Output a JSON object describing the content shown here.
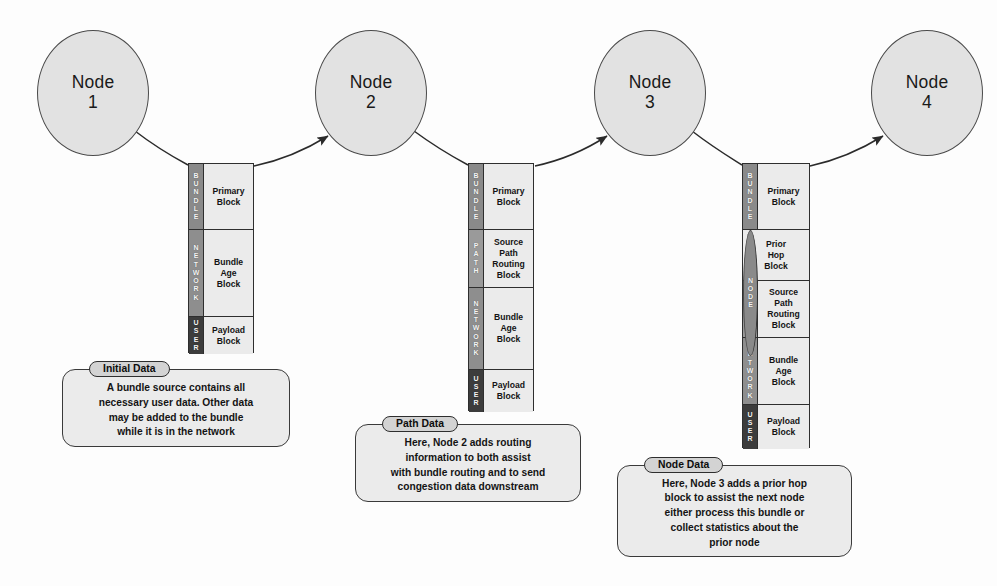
{
  "diagram": {
    "background": "#fdfdfd",
    "nodes": [
      {
        "label": "Node",
        "number": "1"
      },
      {
        "label": "Node",
        "number": "2"
      },
      {
        "label": "Node",
        "number": "3"
      },
      {
        "label": "Node",
        "number": "4"
      }
    ],
    "stacks": [
      {
        "name": "bundle-stack-1",
        "rows": [
          {
            "tier": "BUNDLE",
            "tier_key": "bundle",
            "tier_color": "#8a8a8a",
            "block": [
              "Primary",
              "Block"
            ]
          },
          {
            "tier": "NETWORK",
            "tier_key": "network",
            "tier_color": "#8e8e8e",
            "block": [
              "Bundle",
              "Age",
              "Block"
            ]
          },
          {
            "tier": "USER",
            "tier_key": "user",
            "tier_color": "#3c3c3c",
            "block": [
              "Payload",
              "Block"
            ]
          }
        ]
      },
      {
        "name": "bundle-stack-2",
        "rows": [
          {
            "tier": "BUNDLE",
            "tier_key": "bundle",
            "tier_color": "#8a8a8a",
            "block": [
              "Primary",
              "Block"
            ]
          },
          {
            "tier": "PATH",
            "tier_key": "path",
            "tier_color": "#9a9a9a",
            "block": [
              "Source",
              "Path",
              "Routing",
              "Block"
            ]
          },
          {
            "tier": "NETWORK",
            "tier_key": "network",
            "tier_color": "#8e8e8e",
            "block": [
              "Bundle",
              "Age",
              "Block"
            ]
          },
          {
            "tier": "USER",
            "tier_key": "user",
            "tier_color": "#3c3c3c",
            "block": [
              "Payload",
              "Block"
            ]
          }
        ]
      },
      {
        "name": "bundle-stack-3",
        "rows": [
          {
            "tier": "BUNDLE",
            "tier_key": "bundle",
            "tier_color": "#8a8a8a",
            "block": [
              "Primary",
              "Block"
            ]
          },
          {
            "tier": "NODE",
            "tier_key": "node",
            "tier_color": "#8a8a8a",
            "block": [
              "Prior",
              "Hop",
              "Block"
            ]
          },
          {
            "tier": "PATH",
            "tier_key": "path",
            "tier_color": "#9a9a9a",
            "block": [
              "Source",
              "Path",
              "Routing",
              "Block"
            ]
          },
          {
            "tier": "NETWORK",
            "tier_key": "network",
            "tier_color": "#8e8e8e",
            "block": [
              "Bundle",
              "Age",
              "Block"
            ]
          },
          {
            "tier": "USER",
            "tier_key": "user",
            "tier_color": "#3c3c3c",
            "block": [
              "Payload",
              "Block"
            ]
          }
        ]
      }
    ],
    "callouts": [
      {
        "name": "callout-initial-data",
        "title": "Initial Data",
        "lines": [
          "A bundle source contains all",
          "necessary user data. Other data",
          "may be added to the bundle",
          "while it is in the network"
        ]
      },
      {
        "name": "callout-path-data",
        "title": "Path Data",
        "lines": [
          "Here, Node 2 adds routing",
          "information to both assist",
          "with bundle routing and to send",
          "congestion data downstream"
        ]
      },
      {
        "name": "callout-node-data",
        "title": "Node Data",
        "lines": [
          "Here, Node 3 adds a prior hop",
          "block to assist the next node",
          "either process this bundle or",
          "collect statistics about the",
          "prior node"
        ]
      }
    ]
  }
}
